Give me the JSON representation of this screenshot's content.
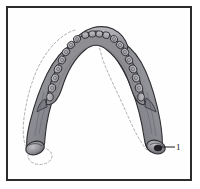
{
  "figure": {
    "name": "mandible-superior-view-diagram",
    "frame": {
      "border_color": "#2b2b2b",
      "background_color": "#fefefe"
    },
    "colors": {
      "bone_fill": "#8f8f93",
      "bone_fill_light": "#b5b5ba",
      "bone_fill_dark": "#6e6e73",
      "outline": "#2f2f33",
      "tooth_fill": "#a9a9ae",
      "tooth_outline": "#2a2a2e",
      "dashed_outline": "#9a9a9e",
      "leader_line": "#1a1a1a",
      "label_text": "#1a1a1a"
    },
    "callouts": [
      {
        "id": "1",
        "label": "1",
        "points_to": "right-condyle"
      }
    ],
    "teeth": {
      "left_count": 8,
      "right_count": 8,
      "total": 16
    },
    "parts": [
      "mandibular-body",
      "left-ramus",
      "right-ramus",
      "left-condyle",
      "right-condyle",
      "coronoid-process",
      "dental-arch",
      "displaced-outline"
    ]
  }
}
